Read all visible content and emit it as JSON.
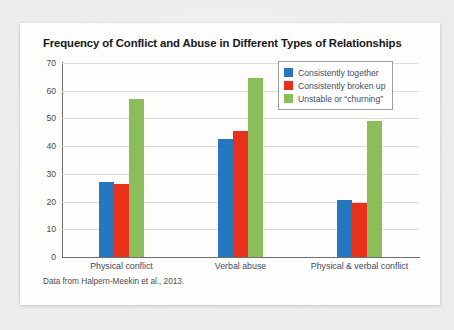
{
  "card": {
    "source_note": "Data from Halpern-Meekin et al., 2013."
  },
  "colors": {
    "series_0": "#2578c0",
    "series_1": "#e8301a",
    "series_2": "#8bbd5b",
    "axis": "#6f6f70",
    "grid": "#dcdcdb",
    "text": "#3f4c66",
    "card_bg": "#fdfdfc",
    "page_bg": "#ececeb"
  },
  "chart_data": {
    "type": "bar",
    "title": "Frequency of Conflict and Abuse in Different Types of Relationships",
    "xlabel": "",
    "ylabel": "",
    "ylim": [
      0,
      70
    ],
    "yticks": [
      70,
      60,
      50,
      40,
      30,
      20,
      10,
      0
    ],
    "grid": true,
    "legend_position": "top-right",
    "categories": [
      "Physical conflict",
      "Verbal abuse",
      "Physical & verbal conflict"
    ],
    "series": [
      {
        "name": "Consistently together",
        "values": [
          27.0,
          42.5,
          20.5
        ]
      },
      {
        "name": "Consistently broken up",
        "values": [
          26.5,
          45.5,
          19.5
        ]
      },
      {
        "name": "Unstable or “churning”",
        "values": [
          57.0,
          64.5,
          49.0
        ]
      }
    ],
    "source": "Data from Halpern-Meekin et al., 2013."
  }
}
